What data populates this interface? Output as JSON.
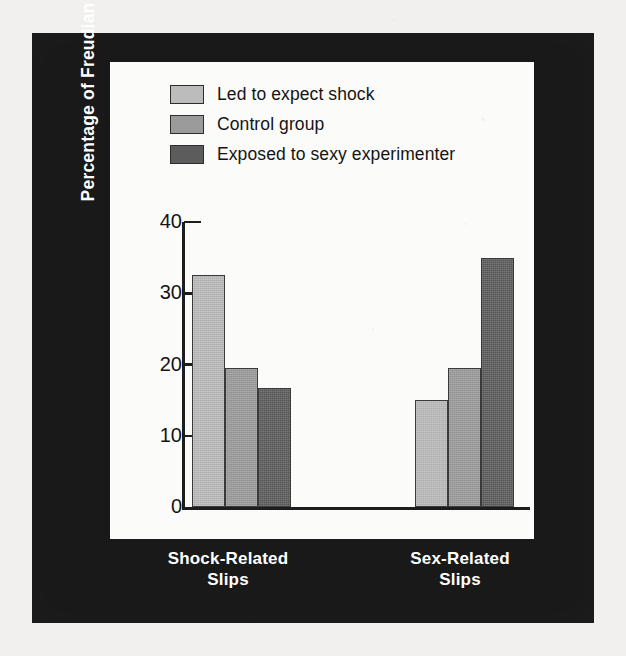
{
  "figure": {
    "background_color": "#191919",
    "plot_background_color": "#fbfbf9",
    "page_color": "#f1f0ee"
  },
  "legend": {
    "position": "top-left-inside",
    "items": [
      {
        "label": "Led to expect shock",
        "color": "#bcbcbc",
        "key": "led-to-expect-shock"
      },
      {
        "label": "Control group",
        "color": "#9b9b9b",
        "key": "control-group"
      },
      {
        "label": "Exposed to sexy experimenter",
        "color": "#5c5c5c",
        "key": "exposed-to-sexy-experimenter"
      }
    ]
  },
  "axes": {
    "y_title": "Percentage of Freudian Slips",
    "y_ticks": [
      "40",
      "30",
      "20",
      "10",
      "0"
    ],
    "x_categories": [
      {
        "line1": "Shock-Related",
        "line2": "Slips"
      },
      {
        "line1": "Sex-Related",
        "line2": "Slips"
      }
    ]
  },
  "chart_data": {
    "type": "bar",
    "title": "",
    "subtitle": "",
    "xlabel": "",
    "ylabel": "Percentage of Freudian Slips",
    "categories": [
      "Shock-Related Slips",
      "Sex-Related Slips"
    ],
    "series": [
      {
        "name": "Led to expect shock",
        "values": [
          32.5,
          15.0
        ],
        "color": "#bcbcbc"
      },
      {
        "name": "Control group",
        "values": [
          19.5,
          19.5
        ],
        "color": "#9b9b9b"
      },
      {
        "name": "Exposed to sexy experimenter",
        "values": [
          16.7,
          35.0
        ],
        "color": "#5c5c5c"
      }
    ],
    "ylim": [
      0,
      40
    ],
    "ytick_values": [
      0,
      10,
      20,
      30,
      40
    ],
    "grid": false,
    "legend_position": "upper left",
    "annotations": []
  }
}
